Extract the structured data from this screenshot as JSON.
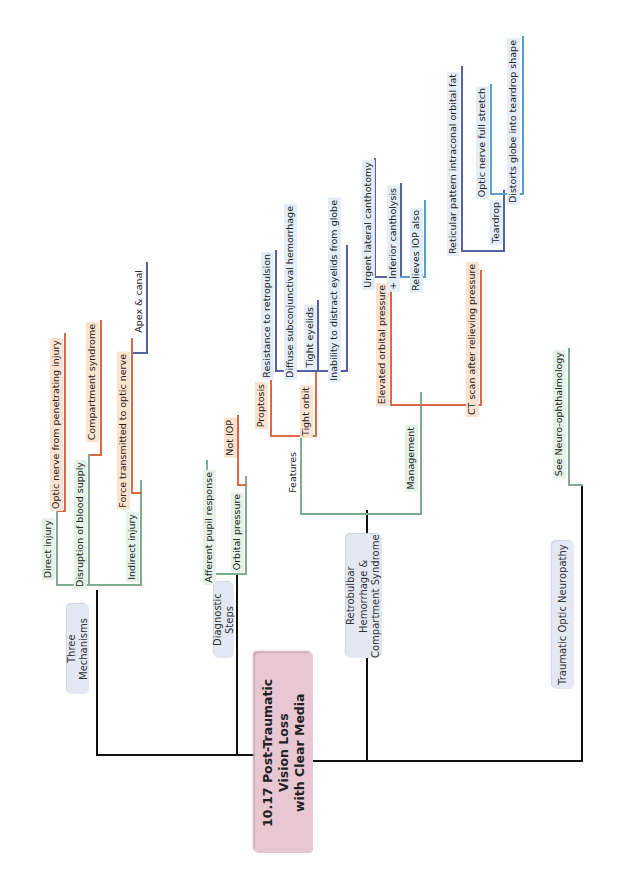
{
  "colors": {
    "root_bg": "#e9c7d2",
    "topic_bg": "#e3e8f3",
    "level1_line": "#7fae8e",
    "level2_line": "#d96a45",
    "level3_line": "#55639e",
    "level4_line": "#5b9fd0",
    "trunk_line": "#111111"
  },
  "root": {
    "line1": "10.17 Post-Traumatic",
    "line2": "Vision Loss",
    "line3": "with Clear Media"
  },
  "branches": {
    "three_mechanisms": {
      "label": "Three Mechanisms",
      "direct": {
        "label": "Direct injury",
        "children": [
          "Optic nerve from penetrating injury"
        ]
      },
      "disruption": {
        "label": "Disruption of blood supply",
        "children": [
          "Compartment syndrome"
        ]
      },
      "indirect": {
        "label": "Indirect injury",
        "force": "Force transmitted to optic nerve",
        "apex": "Apex & canal"
      }
    },
    "diagnostic_steps": {
      "label": "Diagnostic Steps",
      "afferent": "Afferent pupil response",
      "orbital": "Orbital pressure",
      "not_iop": "Not IOP"
    },
    "retrobulbar": {
      "label_line1": "Retrobulbar Hemorrhage &",
      "label_line2": "Compartment Syndrome",
      "features": {
        "label": "Features",
        "proptosis": "Proptosis",
        "tight_orbit": "Tight orbit",
        "resistance": "Resistance to retropulsion",
        "diffuse": "Diffuse subconjunctival hemorrhage",
        "tight_eyelids": "Tight eyelids",
        "inability": "Inability to distract eyelids from globe"
      },
      "management": {
        "label": "Management",
        "elevated": "Elevated orbital pressure",
        "urgent": "Urgent lateral canthotomy",
        "inferior": "+ Inferior cantholysis",
        "relieves": "Relieves IOP also",
        "ct_scan": "CT scan after relieving pressure",
        "reticular": "Reticular pattern intraconal orbital fat",
        "teardrop": "Teardrop",
        "optic_stretch": "Optic nerve full stretch",
        "distorts": "Distorts globe into teardrop shape"
      }
    },
    "traumatic_optic": {
      "label": "Traumatic Optic Neuropathy",
      "see": "See Neuro-ophthalmology"
    }
  }
}
